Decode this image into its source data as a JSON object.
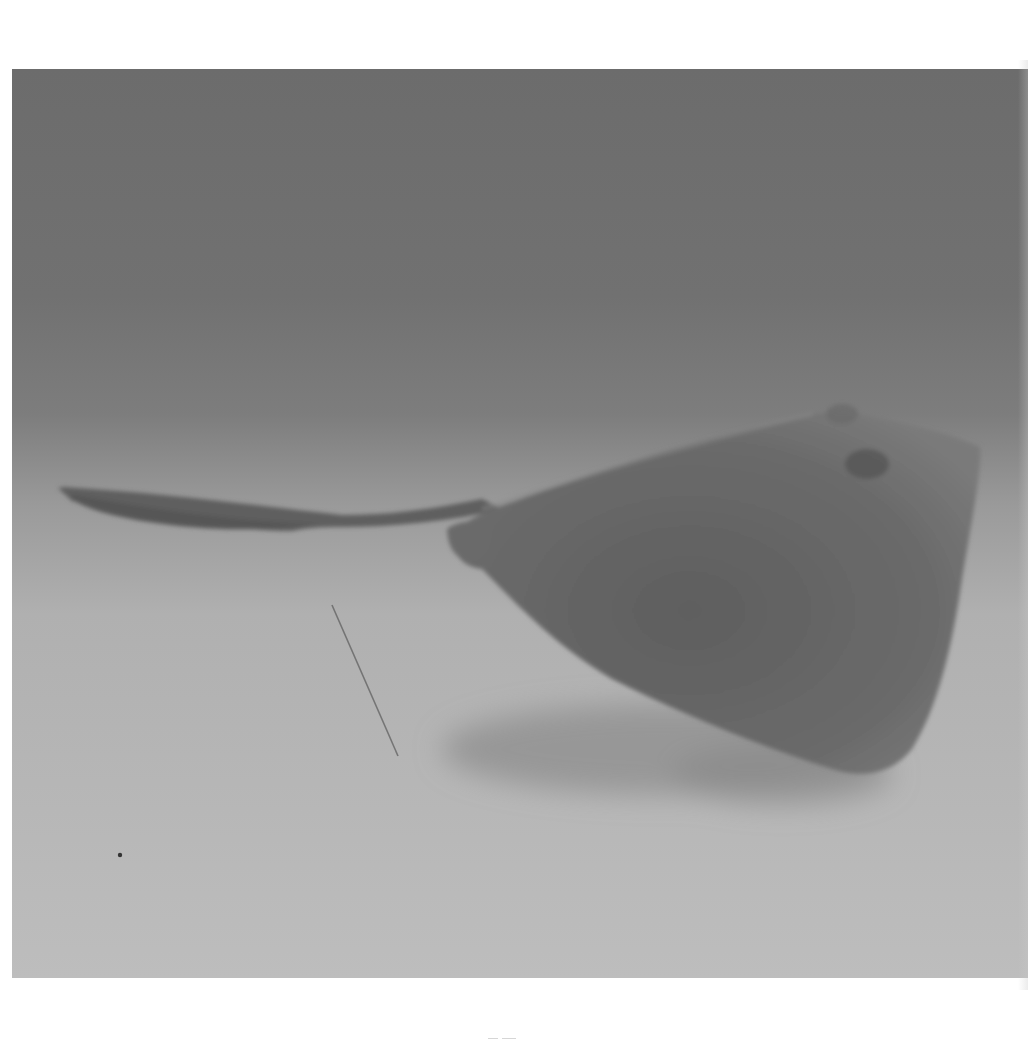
{
  "image": {
    "subject": "stingray",
    "description": "Black-and-white photograph of a stingray gliding just above a sandy seafloor, long whip-like tail extending to the left, its shadow cast on the sand below",
    "style": "grayscale film photograph, grainy",
    "colors": {
      "page_background": "#ffffff",
      "water_top": "#6e6e6e",
      "water_mid": "#858585",
      "sand_light": "#b5b5b5",
      "sand_bottom": "#bdbdbd",
      "ray_body": "#6f6f6f",
      "ray_body_dark": "#5f5f5f",
      "ray_tail": "#626262",
      "shadow": "#9a9a9a",
      "line": "#5a5a5a"
    },
    "elements": [
      {
        "name": "stingray-body",
        "position": "right-center"
      },
      {
        "name": "stingray-tail",
        "position": "left-center"
      },
      {
        "name": "stingray-shadow",
        "position": "below body on sand"
      },
      {
        "name": "fishing-line",
        "position": "center-left, diagonal"
      },
      {
        "name": "sand-speck",
        "position": "lower-left"
      }
    ]
  },
  "layout": {
    "photo_frame": {
      "left": 12,
      "top": 69,
      "width": 1016,
      "height": 909
    }
  }
}
